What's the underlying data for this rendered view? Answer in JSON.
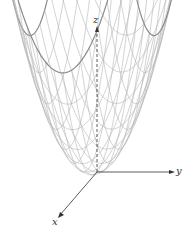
{
  "figure": {
    "surface": "paraboloid",
    "axes": {
      "x": "x",
      "y": "y",
      "z": "z"
    },
    "colors": {
      "mesh": "#b5b5b5",
      "edge": "#8a8a8a",
      "axis": "#333333"
    }
  }
}
